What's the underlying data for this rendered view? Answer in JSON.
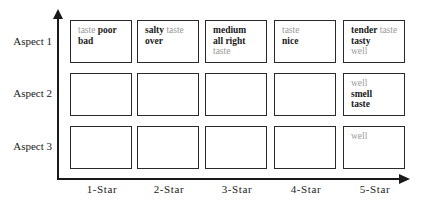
{
  "diagram": {
    "rows": [
      {
        "label": "Aspect 1"
      },
      {
        "label": "Aspect 2"
      },
      {
        "label": "Aspect 3"
      }
    ],
    "columns": [
      {
        "label": "1-Star"
      },
      {
        "label": "2-Star"
      },
      {
        "label": "3-Star"
      },
      {
        "label": "4-Star"
      },
      {
        "label": "5-Star"
      }
    ],
    "cells": {
      "r0c0": [
        [
          {
            "text": "taste",
            "tone": "light"
          },
          {
            "text": "poor",
            "tone": "dark"
          }
        ],
        [
          {
            "text": "bad",
            "tone": "dark"
          }
        ]
      ],
      "r0c1": [
        [
          {
            "text": "salty",
            "tone": "dark"
          },
          {
            "text": "taste",
            "tone": "light"
          }
        ],
        [
          {
            "text": "over",
            "tone": "dark"
          }
        ]
      ],
      "r0c2": [
        [
          {
            "text": "medium",
            "tone": "dark"
          }
        ],
        [
          {
            "text": "all right",
            "tone": "dark"
          }
        ],
        [
          {
            "text": "taste",
            "tone": "light"
          }
        ]
      ],
      "r0c3": [
        [
          {
            "text": "taste",
            "tone": "light"
          }
        ],
        [
          {
            "text": "nice",
            "tone": "dark"
          }
        ]
      ],
      "r0c4": [
        [
          {
            "text": "tender",
            "tone": "dark"
          },
          {
            "text": "taste",
            "tone": "light"
          }
        ],
        [
          {
            "text": "tasty",
            "tone": "dark"
          }
        ],
        [
          {
            "text": "well",
            "tone": "light"
          }
        ]
      ],
      "r1c0": [],
      "r1c1": [],
      "r1c2": [],
      "r1c3": [],
      "r1c4": [
        [
          {
            "text": "well",
            "tone": "light"
          }
        ],
        [
          {
            "text": "smell",
            "tone": "dark"
          }
        ],
        [
          {
            "text": "taste",
            "tone": "dark"
          }
        ]
      ],
      "r2c0": [],
      "r2c1": [],
      "r2c2": [],
      "r2c3": [],
      "r2c4": [
        [
          {
            "text": "well",
            "tone": "light"
          }
        ]
      ]
    },
    "colors": {
      "dark_word": "#1a1a1a",
      "light_word": "#9a9a9a",
      "border": "#2a2a2a",
      "background": "#ffffff"
    }
  }
}
